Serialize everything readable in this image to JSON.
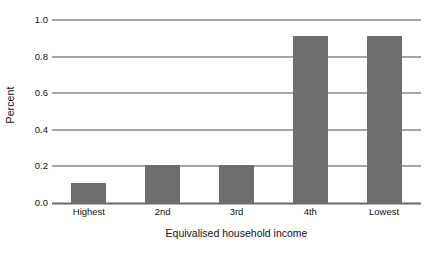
{
  "chart_data": {
    "type": "bar",
    "title": "",
    "subtitle": "",
    "xlabel": "Equivalised household income",
    "ylabel": "Percent",
    "categories": [
      "Highest",
      "2nd",
      "3rd",
      "4th",
      "Lowest"
    ],
    "values": [
      0.11,
      0.21,
      0.21,
      0.91,
      0.91
    ],
    "series": [
      {
        "name": "Percent",
        "values": [
          0.11,
          0.21,
          0.21,
          0.91,
          0.91
        ]
      }
    ],
    "ylim": [
      0.0,
      1.0
    ],
    "ytick_labels": [
      "0.0",
      "0.2",
      "0.4",
      "0.6",
      "0.8",
      "1.0"
    ],
    "ytick_values": [
      0.0,
      0.2,
      0.4,
      0.6,
      0.8,
      1.0
    ],
    "grid": "horizontal",
    "grid_on": true,
    "legend": "none",
    "legend_position": "none",
    "bar_color": "#6e6e6e",
    "gridline_color": "#4d4d4d",
    "axis_color": "#6a6a6a",
    "background_color": "#ffffff",
    "text_color": "#111111"
  }
}
